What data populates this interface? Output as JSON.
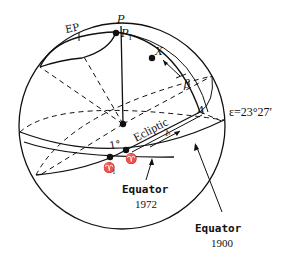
{
  "diagram": {
    "labels": {
      "pole": "P",
      "pole_1": "P",
      "pole_1_sub": "1",
      "ecliptic_pole": "EP",
      "star": "X",
      "latitude": "β",
      "point_a": "A",
      "obliquity": "ε=23°27′",
      "ecliptic": "Ecliptic",
      "longitude": "λ",
      "one_degree": "1°",
      "vernal_equinox": "♈",
      "vernal_equinox_1": "♈",
      "vernal_equinox_1_sub": "1",
      "equator_1972_line1": "Equator",
      "equator_1972_line2": "1972",
      "equator_1900_line1": "Equator",
      "equator_1900_line2": "1900"
    }
  }
}
